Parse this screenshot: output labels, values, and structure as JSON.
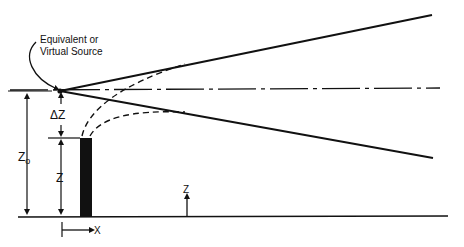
{
  "diagram": {
    "annotation": {
      "line1": "Equivalent or",
      "line2": "Virtual Source"
    },
    "labels": {
      "delta_z": "ΔZ",
      "z0": "Z",
      "z0_subscript": "o",
      "z_stack": "Z",
      "z_axis": "Z",
      "x_axis": "X"
    },
    "elements": [
      "virtual-source-point",
      "upper-plume-boundary",
      "lower-plume-boundary",
      "plume-centerline",
      "stack",
      "ground-line",
      "dashed-plume-rise-curves"
    ],
    "colors": {
      "ink": "#111111",
      "background": "#ffffff"
    }
  }
}
